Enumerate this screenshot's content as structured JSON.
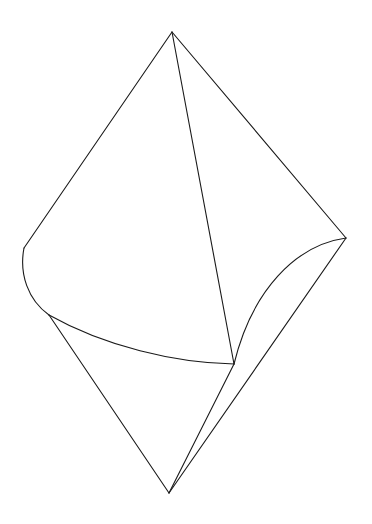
{
  "figure": {
    "type": "line-drawing",
    "background_color": "#ffffff",
    "stroke_color": "#1a1a1a",
    "stroke_width": 1.1,
    "canvas": {
      "width": 372,
      "height": 524
    },
    "vertices": {
      "apex": {
        "label": "apex",
        "x": 172,
        "y": 32
      },
      "left": {
        "label": "left-vertex",
        "x": 24,
        "y": 248
      },
      "right": {
        "label": "right-vertex",
        "x": 346,
        "y": 238
      },
      "bottom": {
        "label": "bottom-vertex",
        "x": 169,
        "y": 493
      },
      "cusp": {
        "label": "left-lower-cusp",
        "x": 49,
        "y": 315
      },
      "node": {
        "label": "central-convergence-node",
        "x": 234,
        "y": 364
      }
    },
    "paths": [
      {
        "name": "edge-apex-to-left",
        "kind": "line",
        "d": "M 172 32 L 24 248"
      },
      {
        "name": "edge-apex-to-right",
        "kind": "line",
        "d": "M 172 32 L 346 238"
      },
      {
        "name": "edge-apex-to-node",
        "kind": "line",
        "d": "M 172 32 L 234 364"
      },
      {
        "name": "curve-left-vertex-to-cusp",
        "kind": "curve",
        "d": "M 24 248 C 19 274 28 300 49 315"
      },
      {
        "name": "curve-cusp-to-node",
        "kind": "curve",
        "d": "M 49 315 C 104 346 175 363 234 364"
      },
      {
        "name": "edge-cusp-to-bottom",
        "kind": "line",
        "d": "M 49 315 L 169 493"
      },
      {
        "name": "curve-right-vertex-to-node",
        "kind": "curve",
        "d": "M 346 238 C 296 245 252 290 234 364"
      },
      {
        "name": "edge-right-vertex-to-bottom",
        "kind": "line",
        "d": "M 346 238 L 169 493"
      },
      {
        "name": "edge-node-to-bottom",
        "kind": "line",
        "d": "M 234 364 L 169 493"
      }
    ]
  }
}
